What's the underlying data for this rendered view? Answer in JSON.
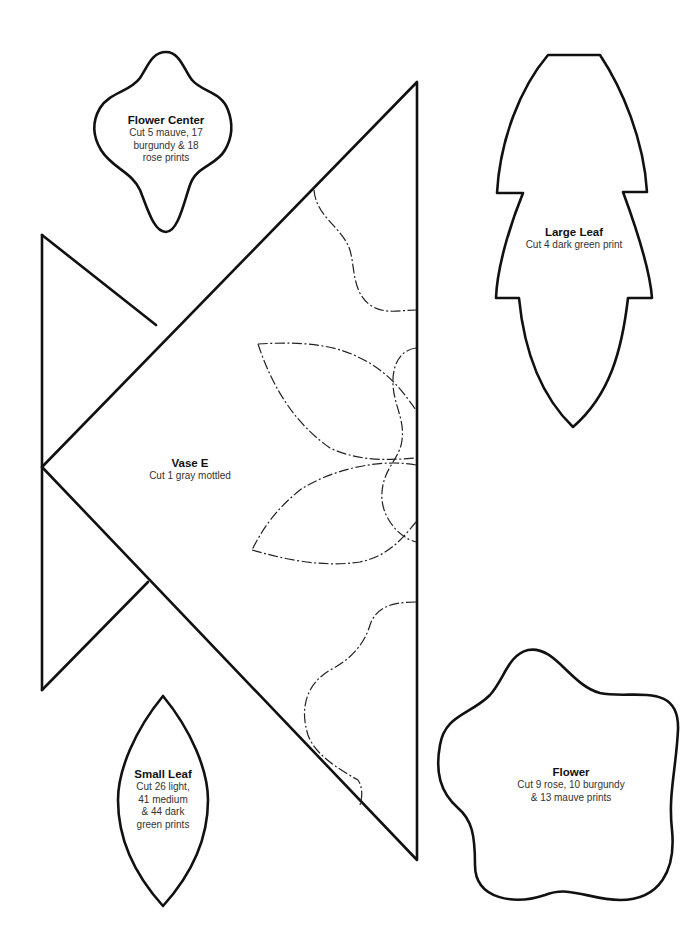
{
  "pieces": {
    "flower_center": {
      "title": "Flower Center",
      "lines": [
        "Cut 5 mauve, 17",
        "burgundy & 18",
        "rose prints"
      ]
    },
    "large_leaf": {
      "title": "Large Leaf",
      "lines": [
        "Cut 4 dark green print"
      ]
    },
    "vase": {
      "title": "Vase E",
      "lines": [
        "Cut 1 gray mottled"
      ]
    },
    "small_leaf": {
      "title": "Small Leaf",
      "lines": [
        "Cut 26 light,",
        "41 medium",
        "& 44 dark",
        "green prints"
      ]
    },
    "flower": {
      "title": "Flower",
      "lines": [
        "Cut 9 rose, 10 burgundy",
        "& 13 mauve prints"
      ]
    }
  },
  "colors": {
    "outline": "#111111",
    "background": "#ffffff"
  }
}
